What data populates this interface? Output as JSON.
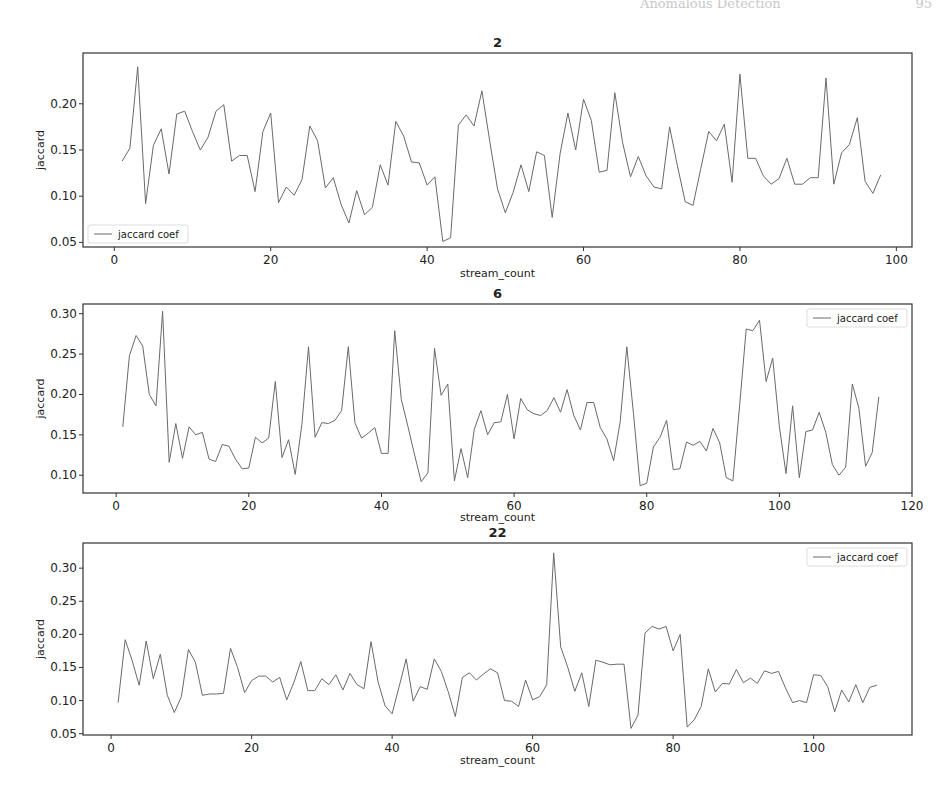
{
  "page": {
    "running_head": "Anomalous Detection",
    "page_number": "95"
  },
  "chart_data": [
    {
      "type": "line",
      "title": "2",
      "xlabel": "stream_count",
      "ylabel": "jaccard",
      "legend": [
        "jaccard coef"
      ],
      "legend_position": "lower left",
      "xlim": [
        -4,
        102
      ],
      "ylim": [
        0.045,
        0.255
      ],
      "xticks": [
        0,
        20,
        40,
        60,
        80,
        100
      ],
      "yticks": [
        0.05,
        0.1,
        0.15,
        0.2
      ],
      "grid": false,
      "x": [
        1,
        2,
        3,
        4,
        5,
        6,
        7,
        8,
        9,
        10,
        11,
        12,
        13,
        14,
        15,
        16,
        17,
        18,
        19,
        20,
        21,
        22,
        23,
        24,
        25,
        26,
        27,
        28,
        29,
        30,
        31,
        32,
        33,
        34,
        35,
        36,
        37,
        38,
        39,
        40,
        41,
        42,
        43,
        44,
        45,
        46,
        47,
        48,
        49,
        50,
        51,
        52,
        53,
        54,
        55,
        56,
        57,
        58,
        59,
        60,
        61,
        62,
        63,
        64,
        65,
        66,
        67,
        68,
        69,
        70,
        71,
        72,
        73,
        74,
        75,
        76,
        77,
        78,
        79,
        80,
        81,
        82,
        83,
        84,
        85,
        86,
        87,
        88,
        89,
        90,
        91,
        92,
        93,
        94,
        95,
        96,
        97,
        98
      ],
      "series": [
        {
          "name": "jaccard coef",
          "values": [
            0.138,
            0.152,
            0.24,
            0.092,
            0.155,
            0.173,
            0.124,
            0.189,
            0.192,
            0.17,
            0.15,
            0.164,
            0.192,
            0.199,
            0.138,
            0.144,
            0.144,
            0.105,
            0.17,
            0.19,
            0.093,
            0.11,
            0.101,
            0.118,
            0.176,
            0.16,
            0.109,
            0.12,
            0.091,
            0.071,
            0.106,
            0.08,
            0.088,
            0.134,
            0.112,
            0.181,
            0.165,
            0.137,
            0.136,
            0.112,
            0.121,
            0.051,
            0.055,
            0.177,
            0.188,
            0.176,
            0.214,
            0.16,
            0.108,
            0.082,
            0.104,
            0.134,
            0.105,
            0.148,
            0.144,
            0.077,
            0.146,
            0.19,
            0.15,
            0.205,
            0.182,
            0.126,
            0.128,
            0.212,
            0.158,
            0.121,
            0.143,
            0.122,
            0.11,
            0.108,
            0.175,
            0.133,
            0.094,
            0.09,
            0.13,
            0.17,
            0.16,
            0.178,
            0.115,
            0.232,
            0.141,
            0.141,
            0.122,
            0.113,
            0.119,
            0.141,
            0.113,
            0.113,
            0.12,
            0.12,
            0.228,
            0.113,
            0.147,
            0.156,
            0.185,
            0.116,
            0.103,
            0.123
          ]
        }
      ]
    },
    {
      "type": "line",
      "title": "6",
      "xlabel": "stream_count",
      "ylabel": "jaccard",
      "legend": [
        "jaccard coef"
      ],
      "legend_position": "upper right",
      "xlim": [
        -5,
        120
      ],
      "ylim": [
        0.078,
        0.312
      ],
      "xticks": [
        0,
        20,
        40,
        60,
        80,
        100,
        120
      ],
      "yticks": [
        0.1,
        0.15,
        0.2,
        0.25,
        0.3
      ],
      "grid": false,
      "x": [
        1,
        2,
        3,
        4,
        5,
        6,
        7,
        8,
        9,
        10,
        11,
        12,
        13,
        14,
        15,
        16,
        17,
        18,
        19,
        20,
        21,
        22,
        23,
        24,
        25,
        26,
        27,
        28,
        29,
        30,
        31,
        32,
        33,
        34,
        35,
        36,
        37,
        38,
        39,
        40,
        41,
        42,
        43,
        44,
        45,
        46,
        47,
        48,
        49,
        50,
        51,
        52,
        53,
        54,
        55,
        56,
        57,
        58,
        59,
        60,
        61,
        62,
        63,
        64,
        65,
        66,
        67,
        68,
        69,
        70,
        71,
        72,
        73,
        74,
        75,
        76,
        77,
        78,
        79,
        80,
        81,
        82,
        83,
        84,
        85,
        86,
        87,
        88,
        89,
        90,
        91,
        92,
        93,
        94,
        95,
        96,
        97,
        98,
        99,
        100,
        101,
        102,
        103,
        104,
        105,
        106,
        107,
        108,
        109,
        110,
        111,
        112,
        113,
        114,
        115
      ],
      "series": [
        {
          "name": "jaccard coef",
          "values": [
            0.16,
            0.248,
            0.273,
            0.26,
            0.2,
            0.186,
            0.303,
            0.116,
            0.164,
            0.121,
            0.16,
            0.15,
            0.153,
            0.12,
            0.117,
            0.138,
            0.136,
            0.12,
            0.108,
            0.109,
            0.147,
            0.14,
            0.146,
            0.216,
            0.122,
            0.144,
            0.101,
            0.163,
            0.259,
            0.147,
            0.165,
            0.164,
            0.168,
            0.18,
            0.259,
            0.165,
            0.146,
            0.152,
            0.159,
            0.127,
            0.127,
            0.279,
            0.194,
            0.16,
            0.125,
            0.092,
            0.103,
            0.257,
            0.199,
            0.213,
            0.093,
            0.133,
            0.097,
            0.157,
            0.18,
            0.15,
            0.165,
            0.166,
            0.2,
            0.145,
            0.195,
            0.181,
            0.176,
            0.174,
            0.18,
            0.196,
            0.178,
            0.206,
            0.174,
            0.156,
            0.19,
            0.19,
            0.159,
            0.145,
            0.118,
            0.166,
            0.259,
            0.176,
            0.087,
            0.09,
            0.135,
            0.147,
            0.168,
            0.107,
            0.108,
            0.141,
            0.137,
            0.142,
            0.13,
            0.158,
            0.14,
            0.097,
            0.093,
            0.186,
            0.281,
            0.279,
            0.292,
            0.216,
            0.245,
            0.16,
            0.102,
            0.186,
            0.097,
            0.154,
            0.156,
            0.178,
            0.153,
            0.113,
            0.1,
            0.11,
            0.213,
            0.183,
            0.111,
            0.128,
            0.197
          ]
        }
      ]
    },
    {
      "type": "line",
      "title": "22",
      "xlabel": "stream_count",
      "ylabel": "jaccard",
      "legend": [
        "jaccard coef"
      ],
      "legend_position": "upper right",
      "xlim": [
        -4,
        114
      ],
      "ylim": [
        0.048,
        0.338
      ],
      "xticks": [
        0,
        20,
        40,
        60,
        80,
        100
      ],
      "yticks": [
        0.05,
        0.1,
        0.15,
        0.2,
        0.25,
        0.3
      ],
      "grid": false,
      "x": [
        1,
        2,
        3,
        4,
        5,
        6,
        7,
        8,
        9,
        10,
        11,
        12,
        13,
        14,
        15,
        16,
        17,
        18,
        19,
        20,
        21,
        22,
        23,
        24,
        25,
        26,
        27,
        28,
        29,
        30,
        31,
        32,
        33,
        34,
        35,
        36,
        37,
        38,
        39,
        40,
        41,
        42,
        43,
        44,
        45,
        46,
        47,
        48,
        49,
        50,
        51,
        52,
        53,
        54,
        55,
        56,
        57,
        58,
        59,
        60,
        61,
        62,
        63,
        64,
        65,
        66,
        67,
        68,
        69,
        70,
        71,
        72,
        73,
        74,
        75,
        76,
        77,
        78,
        79,
        80,
        81,
        82,
        83,
        84,
        85,
        86,
        87,
        88,
        89,
        90,
        91,
        92,
        93,
        94,
        95,
        96,
        97,
        98,
        99,
        100,
        101,
        102,
        103,
        104,
        105,
        106,
        107,
        108,
        109
      ],
      "series": [
        {
          "name": "jaccard coef",
          "values": [
            0.097,
            0.192,
            0.16,
            0.123,
            0.19,
            0.133,
            0.17,
            0.108,
            0.082,
            0.106,
            0.177,
            0.158,
            0.108,
            0.11,
            0.11,
            0.111,
            0.179,
            0.15,
            0.112,
            0.13,
            0.137,
            0.137,
            0.128,
            0.135,
            0.101,
            0.127,
            0.159,
            0.115,
            0.115,
            0.133,
            0.124,
            0.139,
            0.116,
            0.141,
            0.124,
            0.118,
            0.189,
            0.128,
            0.092,
            0.08,
            0.121,
            0.163,
            0.099,
            0.121,
            0.117,
            0.163,
            0.144,
            0.113,
            0.076,
            0.135,
            0.142,
            0.131,
            0.14,
            0.148,
            0.142,
            0.1,
            0.099,
            0.091,
            0.131,
            0.101,
            0.106,
            0.124,
            0.323,
            0.181,
            0.15,
            0.114,
            0.142,
            0.091,
            0.161,
            0.158,
            0.154,
            0.155,
            0.155,
            0.058,
            0.078,
            0.202,
            0.212,
            0.208,
            0.212,
            0.175,
            0.2,
            0.06,
            0.071,
            0.091,
            0.148,
            0.113,
            0.126,
            0.125,
            0.147,
            0.127,
            0.134,
            0.126,
            0.145,
            0.141,
            0.144,
            0.119,
            0.097,
            0.1,
            0.097,
            0.139,
            0.138,
            0.121,
            0.083,
            0.116,
            0.098,
            0.124,
            0.097,
            0.12,
            0.123
          ]
        }
      ]
    }
  ]
}
